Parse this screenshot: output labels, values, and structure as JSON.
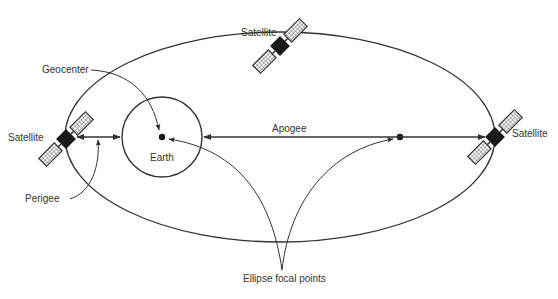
{
  "diagram": {
    "type": "orbit-diagram",
    "colors": {
      "stroke": "#333333",
      "satellite_body": "#1a1a1a",
      "background": "#ffffff"
    },
    "labels": {
      "satellite_top": "Satellite",
      "satellite_left": "Satellite",
      "satellite_right": "Satellite",
      "geocenter": "Geocenter",
      "earth": "Earth",
      "apogee": "Apogee",
      "perigee": "Perigee",
      "focal_points": "Ellipse focal points"
    },
    "icons": {
      "satellite": "satellite-icon",
      "earth": "circle-outline",
      "focal_point": "filled-dot",
      "arrow": "arrowhead"
    }
  }
}
